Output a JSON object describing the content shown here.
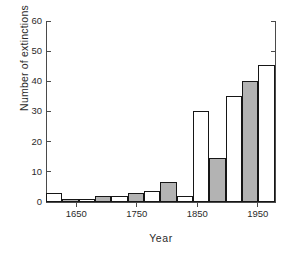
{
  "chart_data": {
    "type": "bar",
    "title": "",
    "subtitle": "",
    "xlabel": "Year",
    "ylabel": "Number of extinctions",
    "xlim": [
      1600,
      1980
    ],
    "ylim": [
      0,
      60
    ],
    "grid": false,
    "legend": null,
    "bar_style": "histogram, alternating white/gray fill, black outline",
    "bin_width": 27,
    "yticks": [
      0,
      10,
      20,
      30,
      40,
      50,
      60
    ],
    "ytick_labels": [
      "0",
      "10",
      "20",
      "30",
      "40",
      "50",
      "60"
    ],
    "xticks": [
      1650,
      1750,
      1850,
      1950
    ],
    "xtick_labels": [
      "1650",
      "1750",
      "1850",
      "1950"
    ],
    "categories": [
      "1600-1627",
      "1627-1654",
      "1654-1681",
      "1681-1708",
      "1708-1735",
      "1735-1762",
      "1762-1789",
      "1789-1816",
      "1816-1843",
      "1843-1870",
      "1870-1897",
      "1897-1924",
      "1924-1951",
      "1951-1978"
    ],
    "bin_starts": [
      1600,
      1627,
      1654,
      1681,
      1708,
      1735,
      1762,
      1789,
      1816,
      1843,
      1870,
      1897,
      1924,
      1951
    ],
    "values": [
      3,
      1,
      1,
      2,
      2,
      3,
      3.5,
      6.5,
      2,
      30,
      14.5,
      35,
      40,
      45.5
    ],
    "fills": [
      "white",
      "gray",
      "white",
      "gray",
      "white",
      "gray",
      "white",
      "gray",
      "white",
      "white",
      "gray",
      "white",
      "gray",
      "white"
    ]
  },
  "colors": {
    "bar_gray": "#b3b3b3",
    "bar_white": "#ffffff",
    "bar_outline": "#161616",
    "axis": "#4a4a4a",
    "text": "#2b2b2b",
    "background": "#ffffff"
  }
}
